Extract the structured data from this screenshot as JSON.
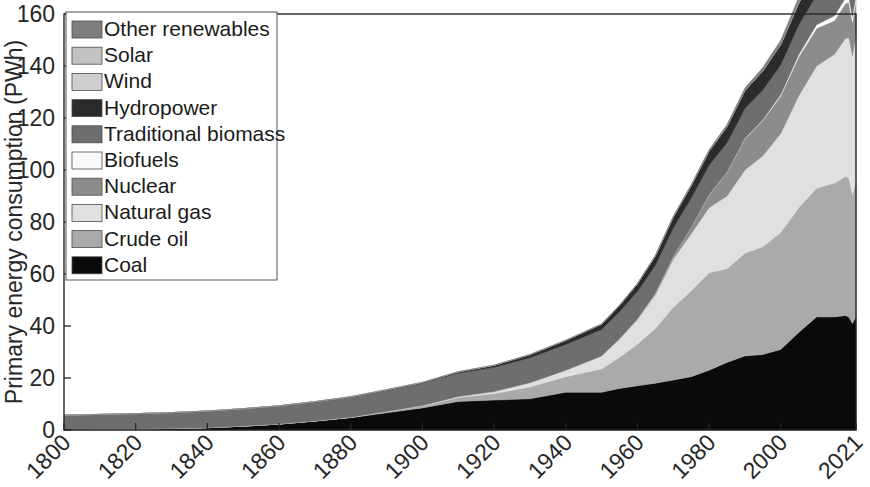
{
  "chart_data": {
    "type": "area",
    "stacked": true,
    "title": "",
    "xlabel": "",
    "ylabel": "Primary energy consumption (PWh)",
    "xlim": [
      1800,
      2021
    ],
    "ylim": [
      0,
      160
    ],
    "yticks": [
      0,
      20,
      40,
      60,
      80,
      100,
      120,
      140,
      160
    ],
    "xticks": [
      1800,
      1820,
      1840,
      1860,
      1880,
      1900,
      1920,
      1940,
      1960,
      1980,
      2000,
      2021
    ],
    "xtick_labels": [
      "1800",
      "1820",
      "1840",
      "1860",
      "1880",
      "1900",
      "1920",
      "1940",
      "1960",
      "1980",
      "2000",
      "2021"
    ],
    "ytick_labels": [
      "0",
      "20",
      "40",
      "60",
      "80",
      "100",
      "120",
      "140",
      "160"
    ],
    "grid": false,
    "legend_position": "upper-left",
    "legend_order_top_to_bottom": [
      "Other renewables",
      "Solar",
      "Wind",
      "Hydropower",
      "Traditional biomass",
      "Biofuels",
      "Nuclear",
      "Natural gas",
      "Crude oil",
      "Coal"
    ],
    "x": [
      1800,
      1810,
      1820,
      1830,
      1840,
      1850,
      1860,
      1870,
      1880,
      1890,
      1900,
      1910,
      1920,
      1930,
      1940,
      1950,
      1955,
      1960,
      1965,
      1970,
      1975,
      1980,
      1985,
      1990,
      1995,
      2000,
      2005,
      2010,
      2015,
      2018,
      2019,
      2020,
      2021
    ],
    "series": [
      {
        "name": "Coal",
        "color": "#0a0a0a",
        "values": [
          0.2,
          0.3,
          0.4,
          0.6,
          0.9,
          1.5,
          2.3,
          3.4,
          4.7,
          6.6,
          8.5,
          11.0,
          11.5,
          12.0,
          14.5,
          14.5,
          16.0,
          17.0,
          18.0,
          19.2,
          20.5,
          23.0,
          26.0,
          28.5,
          29.0,
          31.0,
          37.5,
          43.5,
          43.5,
          44.0,
          43.5,
          41.0,
          43.5
        ]
      },
      {
        "name": "Crude oil",
        "color": "#aaaaaa",
        "values": [
          0.0,
          0.0,
          0.0,
          0.0,
          0.0,
          0.0,
          0.0,
          0.1,
          0.2,
          0.4,
          0.7,
          1.5,
          2.5,
          4.5,
          6.0,
          9.0,
          12.0,
          16.0,
          21.0,
          28.0,
          33.0,
          37.5,
          36.0,
          39.5,
          41.5,
          45.0,
          48.0,
          49.5,
          51.5,
          53.5,
          53.5,
          49.5,
          52.5
        ]
      },
      {
        "name": "Natural gas",
        "color": "#e0e0e0",
        "values": [
          0.0,
          0.0,
          0.0,
          0.0,
          0.0,
          0.0,
          0.0,
          0.0,
          0.0,
          0.1,
          0.2,
          0.4,
          0.8,
          1.7,
          2.5,
          5.0,
          7.0,
          9.5,
          13.0,
          18.5,
          22.0,
          25.0,
          28.0,
          32.0,
          35.0,
          38.0,
          43.0,
          47.0,
          49.5,
          53.0,
          54.0,
          53.5,
          55.5
        ]
      },
      {
        "name": "Nuclear",
        "color": "#8c8c8c",
        "values": [
          0.0,
          0.0,
          0.0,
          0.0,
          0.0,
          0.0,
          0.0,
          0.0,
          0.0,
          0.0,
          0.0,
          0.0,
          0.0,
          0.0,
          0.0,
          0.0,
          0.1,
          0.2,
          0.6,
          1.0,
          2.5,
          5.0,
          9.0,
          12.0,
          13.5,
          14.5,
          15.0,
          14.5,
          13.0,
          13.5,
          13.5,
          13.0,
          13.5
        ]
      },
      {
        "name": "Biofuels",
        "color": "#fafafa",
        "values": [
          0.0,
          0.0,
          0.0,
          0.0,
          0.0,
          0.0,
          0.0,
          0.0,
          0.0,
          0.0,
          0.0,
          0.0,
          0.0,
          0.0,
          0.0,
          0.0,
          0.0,
          0.0,
          0.0,
          0.0,
          0.0,
          0.05,
          0.1,
          0.2,
          0.3,
          0.5,
          0.8,
          1.4,
          1.8,
          2.0,
          2.1,
          2.0,
          2.1
        ]
      },
      {
        "name": "Traditional biomass",
        "color": "#6e6e6e",
        "values": [
          5.5,
          5.7,
          5.9,
          6.1,
          6.4,
          6.7,
          7.0,
          7.4,
          7.8,
          8.2,
          8.6,
          9.0,
          9.3,
          9.6,
          9.9,
          10.2,
          10.4,
          10.6,
          10.8,
          11.0,
          11.2,
          11.3,
          11.4,
          11.5,
          11.5,
          11.5,
          11.5,
          11.4,
          11.3,
          11.2,
          11.2,
          11.2,
          11.2
        ]
      },
      {
        "name": "Hydropower",
        "color": "#2b2b2b",
        "values": [
          0.0,
          0.0,
          0.0,
          0.0,
          0.0,
          0.0,
          0.0,
          0.0,
          0.1,
          0.2,
          0.3,
          0.5,
          0.8,
          1.2,
          1.6,
          2.0,
          2.4,
          2.9,
          3.5,
          4.2,
          4.8,
          5.4,
          6.2,
          6.8,
          7.3,
          7.7,
          8.2,
          9.0,
          9.6,
          10.0,
          10.2,
          10.3,
          10.3
        ]
      },
      {
        "name": "Wind",
        "color": "#cfcfcf",
        "values": [
          0.0,
          0.0,
          0.0,
          0.0,
          0.0,
          0.0,
          0.0,
          0.0,
          0.0,
          0.0,
          0.0,
          0.0,
          0.0,
          0.0,
          0.0,
          0.0,
          0.0,
          0.0,
          0.0,
          0.0,
          0.0,
          0.0,
          0.0,
          0.02,
          0.05,
          0.1,
          0.25,
          0.9,
          2.1,
          3.2,
          3.6,
          4.1,
          4.8
        ]
      },
      {
        "name": "Solar",
        "color": "#c2c2c2",
        "values": [
          0.0,
          0.0,
          0.0,
          0.0,
          0.0,
          0.0,
          0.0,
          0.0,
          0.0,
          0.0,
          0.0,
          0.0,
          0.0,
          0.0,
          0.0,
          0.0,
          0.0,
          0.0,
          0.0,
          0.0,
          0.0,
          0.0,
          0.0,
          0.0,
          0.0,
          0.01,
          0.03,
          0.1,
          0.7,
          1.5,
          1.9,
          2.3,
          2.9
        ]
      },
      {
        "name": "Other renewables",
        "color": "#7d7d7d",
        "values": [
          0.0,
          0.0,
          0.0,
          0.0,
          0.0,
          0.0,
          0.0,
          0.0,
          0.0,
          0.0,
          0.0,
          0.0,
          0.0,
          0.0,
          0.0,
          0.05,
          0.08,
          0.12,
          0.2,
          0.3,
          0.4,
          0.55,
          0.8,
          1.0,
          1.3,
          1.6,
          2.0,
          2.6,
          3.3,
          3.8,
          4.0,
          4.1,
          4.3
        ]
      }
    ]
  },
  "legend": {
    "items": [
      {
        "label": "Other renewables",
        "color": "#7d7d7d"
      },
      {
        "label": "Solar",
        "color": "#c2c2c2"
      },
      {
        "label": "Wind",
        "color": "#cfcfcf"
      },
      {
        "label": "Hydropower",
        "color": "#2b2b2b"
      },
      {
        "label": "Traditional biomass",
        "color": "#6e6e6e"
      },
      {
        "label": "Biofuels",
        "color": "#fafafa"
      },
      {
        "label": "Nuclear",
        "color": "#8c8c8c"
      },
      {
        "label": "Natural gas",
        "color": "#e0e0e0"
      },
      {
        "label": "Crude oil",
        "color": "#aaaaaa"
      },
      {
        "label": "Coal",
        "color": "#0a0a0a"
      }
    ]
  },
  "axes": {
    "y_title": "Primary energy consumption (PWh)"
  }
}
